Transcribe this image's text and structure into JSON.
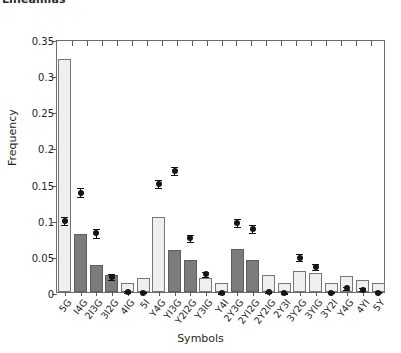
{
  "top_caption": "Lineamias",
  "axis": {
    "ylabel": "Frequency",
    "xlabel": "Symbols",
    "yticks": [
      "0",
      "0.05",
      "0.1",
      "0.15",
      "0.2",
      "0.25",
      "0.3",
      "0.35"
    ]
  },
  "chart_data": {
    "type": "bar",
    "title": "",
    "subtitle": "",
    "xlabel": "Symbols",
    "ylabel": "Frequency",
    "ylim": [
      0,
      0.35
    ],
    "ytick_values": [
      0,
      0.05,
      0.1,
      0.15,
      0.2,
      0.25,
      0.3,
      0.35
    ],
    "grid": false,
    "legend": "none",
    "legend_position": "none",
    "bar_colors": {
      "light": "#efefef",
      "dark": "#7c7c7c",
      "edge": "#777777",
      "marker": "#151515"
    },
    "categories": [
      "5G",
      "I4G",
      "2I3G",
      "3I2G",
      "4IG",
      "5I",
      "Y4G",
      "YI3G",
      "Y2I2G",
      "Y3IG",
      "Y4I",
      "2Y3G",
      "2YI2G",
      "2Y2IG",
      "2Y3I",
      "3Y2G",
      "3YIG",
      "3Y2I",
      "Y4G",
      "4YI",
      "5Y"
    ],
    "series": [
      {
        "name": "Expected frequency",
        "type": "bar",
        "values": [
          0.322,
          0.08,
          0.038,
          0.023,
          0.013,
          0.019,
          0.104,
          0.058,
          0.044,
          0.019,
          0.012,
          0.059,
          0.044,
          0.023,
          0.012,
          0.029,
          0.026,
          0.012,
          0.022,
          0.016,
          0.013
        ],
        "shades": [
          "light",
          "dark",
          "dark",
          "dark",
          "light",
          "light",
          "light",
          "dark",
          "dark",
          "light",
          "light",
          "dark",
          "dark",
          "light",
          "light",
          "light",
          "light",
          "light",
          "light",
          "light",
          "light"
        ]
      },
      {
        "name": "Observed frequency",
        "type": "scatter-errorbar",
        "values": [
          0.101,
          0.14,
          0.084,
          0.024,
          0.003,
          0.002,
          0.152,
          0.17,
          0.077,
          0.027,
          0.001,
          0.098,
          0.09,
          0.003,
          0.001,
          0.05,
          0.037,
          0.002,
          0.008,
          0.006,
          0.002
        ],
        "errors": [
          0.006,
          0.006,
          0.006,
          0.004,
          0.001,
          0.001,
          0.006,
          0.006,
          0.005,
          0.004,
          0.001,
          0.006,
          0.006,
          0.001,
          0.001,
          0.005,
          0.004,
          0.001,
          0.002,
          0.002,
          0.001
        ]
      }
    ]
  }
}
